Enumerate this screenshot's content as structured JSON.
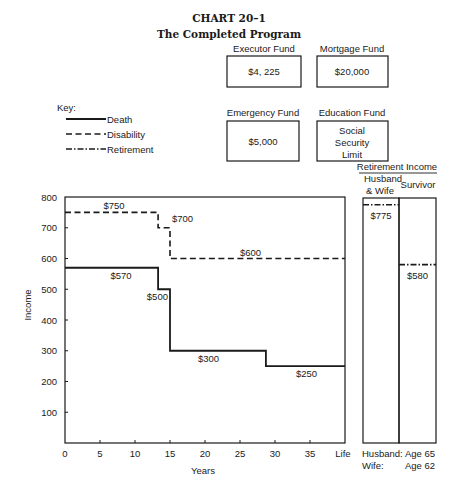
{
  "header": {
    "chart_number": "CHART 20–1",
    "subtitle": "The Completed Program"
  },
  "funds": [
    {
      "label": "Executor Fund",
      "value_lines": [
        "$4, 225"
      ]
    },
    {
      "label": "Mortgage Fund",
      "value_lines": [
        "$20,000"
      ]
    },
    {
      "label": "Emergency Fund",
      "value_lines": [
        "$5,000"
      ]
    },
    {
      "label": "Education Fund",
      "value_lines": [
        "Social",
        "Security",
        "Limit"
      ]
    }
  ],
  "legend": {
    "title": "Key:",
    "items": [
      {
        "label": "Death",
        "style": "solid"
      },
      {
        "label": "Disability",
        "style": "dashed"
      },
      {
        "label": "Retirement",
        "style": "dash-dot"
      }
    ]
  },
  "retirement_panel": {
    "title": "Retirement Income",
    "col1_line1": "Husband",
    "col1_line2": "& Wife",
    "col2": "Survivor",
    "husband_wife_value": "$775",
    "survivor_value": "$580",
    "footer_row1_label": "Husband:",
    "footer_row1_value": "Age 65",
    "footer_row2_label": "Wife:",
    "footer_row2_value": "Age 62"
  },
  "chart_data": {
    "type": "line",
    "title": "CHART 20–1 The Completed Program",
    "xlabel": "Years",
    "ylabel": "Income",
    "x_ticks": [
      "0",
      "5",
      "10",
      "15",
      "20",
      "25",
      "30",
      "35",
      "Life"
    ],
    "x_tick_values": [
      0,
      5,
      10,
      15,
      20,
      25,
      30,
      35,
      40
    ],
    "y_ticks": [
      800,
      700,
      600,
      500,
      400,
      300,
      200,
      100
    ],
    "ylim": [
      0,
      800
    ],
    "xlim": [
      0,
      40
    ],
    "grid": false,
    "legend_position": "upper-left (above plot)",
    "series": [
      {
        "name": "Death",
        "style": "solid",
        "steps": [
          {
            "from": 0,
            "to": 13.3,
            "value": 570,
            "label": "$570",
            "label_x": 8,
            "label_dy": 11
          },
          {
            "from": 13.3,
            "to": 15,
            "value": 500,
            "label": "$500",
            "label_x": 13.2,
            "label_dy": 11
          },
          {
            "from": 15,
            "to": 28.7,
            "value": 300,
            "label": "$300",
            "label_x": 20.5,
            "label_dy": 11
          },
          {
            "from": 28.7,
            "to": 40,
            "value": 250,
            "label": "$250",
            "label_x": 34.5,
            "label_dy": 11
          }
        ]
      },
      {
        "name": "Disability",
        "style": "dashed",
        "steps": [
          {
            "from": 0,
            "to": 13.3,
            "value": 750,
            "label": "$750",
            "label_x": 7,
            "label_dy": -3
          },
          {
            "from": 13.3,
            "to": 15,
            "value": 700,
            "label": "$700",
            "label_x": 16.8,
            "label_dy": -6
          },
          {
            "from": 15,
            "to": 40,
            "value": 600,
            "label": "$600",
            "label_x": 26.5,
            "label_dy": -3
          }
        ]
      },
      {
        "name": "Retirement",
        "style": "dash-dot",
        "bars": [
          {
            "category": "Husband & Wife",
            "value": 775,
            "label": "$775"
          },
          {
            "category": "Survivor",
            "value": 580,
            "label": "$580"
          }
        ]
      }
    ]
  }
}
